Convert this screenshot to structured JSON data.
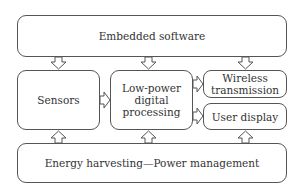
{
  "diagram": {
    "nodes": {
      "embedded_software": "Embedded software",
      "sensors": "Sensors",
      "low_power_processing": "Low-power digital processing",
      "low_power_line1": "Low-power",
      "low_power_line2": "digital",
      "low_power_line3": "processing",
      "wireless_line1": "Wireless",
      "wireless_line2": "transmission",
      "user_display": "User display",
      "energy": "Energy harvesting—Power management"
    },
    "edges": [
      {
        "from": "Embedded software",
        "to": "Sensors"
      },
      {
        "from": "Embedded software",
        "to": "Low-power digital processing"
      },
      {
        "from": "Embedded software",
        "to": "Wireless transmission"
      },
      {
        "from": "Sensors",
        "to": "Low-power digital processing"
      },
      {
        "from": "Low-power digital processing",
        "to": "Wireless transmission"
      },
      {
        "from": "Low-power digital processing",
        "to": "User display"
      },
      {
        "from": "Energy harvesting—Power management",
        "to": "Sensors"
      },
      {
        "from": "Energy harvesting—Power management",
        "to": "Low-power digital processing"
      },
      {
        "from": "Energy harvesting—Power management",
        "to": "User display"
      }
    ]
  }
}
